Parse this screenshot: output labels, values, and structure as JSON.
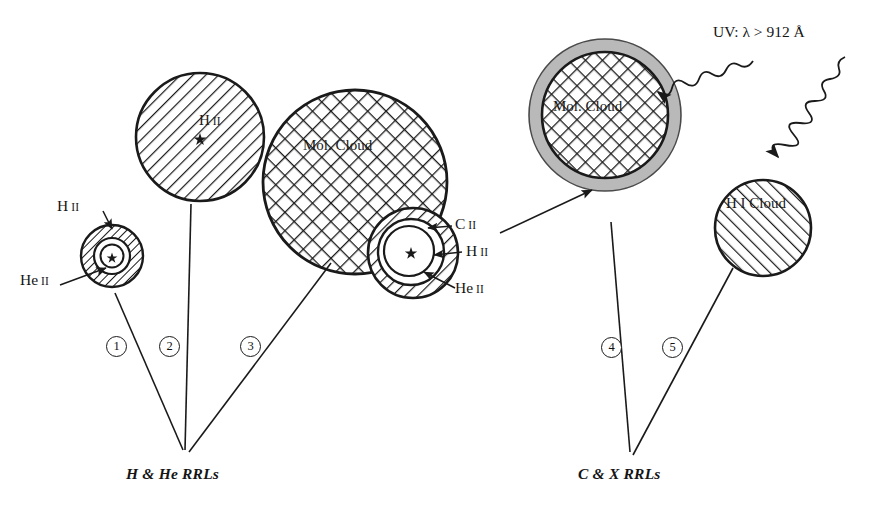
{
  "figure": {
    "background": "#ffffff",
    "ink": "#1a1a1a",
    "gray_shell": "#b9b9b9"
  },
  "uv_annotation": {
    "text": "UV: λ > 912 Å",
    "name": "uv-radiation-label"
  },
  "objects": [
    {
      "id": 1,
      "number_label": "①",
      "caption": "",
      "labels": [
        {
          "text": "H",
          "roman": "II",
          "name": "h-ii-label-object1"
        },
        {
          "text": "He",
          "roman": "II",
          "name": "he-ii-label-object1"
        }
      ]
    },
    {
      "id": 2,
      "number_label": "②",
      "caption": "",
      "labels": [
        {
          "text": "H",
          "roman": "II",
          "name": "h-ii-label-object2"
        }
      ]
    },
    {
      "id": 3,
      "number_label": "③",
      "caption": "Mol.  Cloud",
      "labels": [
        {
          "text": "C",
          "roman": "II",
          "name": "c-ii-label-object3"
        },
        {
          "text": "H",
          "roman": "II",
          "name": "h-ii-label-object3"
        },
        {
          "text": "He",
          "roman": "II",
          "name": "he-ii-label-object3"
        }
      ]
    },
    {
      "id": 4,
      "number_label": "④",
      "caption": "Mol.  Cloud",
      "labels": []
    },
    {
      "id": 5,
      "number_label": "⑤",
      "caption": "H I Cloud",
      "labels": []
    }
  ],
  "captions": {
    "mol_cloud_3": "Mol.  Cloud",
    "mol_cloud_4": "Mol.  Cloud",
    "hi_cloud_5": "H I Cloud",
    "h_label_1": "H",
    "he_label_1": "He",
    "h_label_2": "H",
    "c_label_3": "C",
    "h_label_3": "H",
    "he_label_3": "He",
    "roman_ii": "II"
  },
  "footers": [
    {
      "text": "H & He RRLs",
      "name": "footer-h-he-rrls"
    },
    {
      "text": "C & X RRLs",
      "name": "footer-c-x-rrls"
    }
  ],
  "numbers": {
    "n1": "1",
    "n2": "2",
    "n3": "3",
    "n4": "4",
    "n5": "5"
  }
}
